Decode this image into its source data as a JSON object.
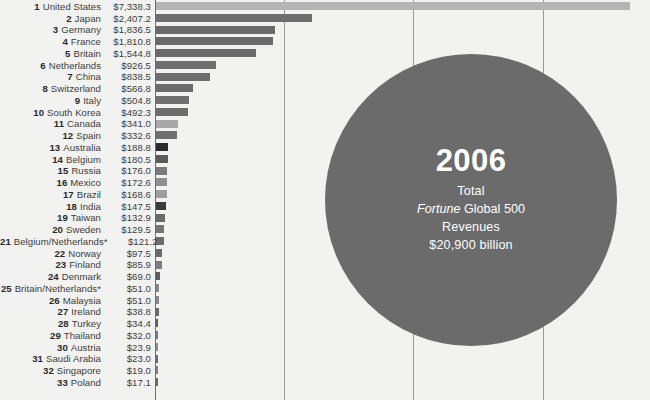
{
  "chart_data": {
    "type": "bar",
    "title": "",
    "orientation": "horizontal",
    "xlabel": "",
    "ylabel": "",
    "grid": true,
    "gridlines_x": [
      0,
      2000,
      4000,
      6000,
      8000
    ],
    "xlim": [
      0,
      7600
    ],
    "value_prefix": "$",
    "units": "billions of dollars",
    "categories": [
      "United States",
      "Japan",
      "Germany",
      "France",
      "Britain",
      "Netherlands",
      "China",
      "Switzerland",
      "Italy",
      "South Korea",
      "Canada",
      "Spain",
      "Australia",
      "Belgium",
      "Russia",
      "Mexico",
      "Brazil",
      "India",
      "Taiwan",
      "Sweden",
      "Belgium/Netherlands*",
      "Norway",
      "Finland",
      "Denmark",
      "Britain/Netherlands*",
      "Malaysia",
      "Ireland",
      "Turkey",
      "Thailand",
      "Austria",
      "Saudi Arabia",
      "Singapore",
      "Poland"
    ],
    "values": [
      7338.3,
      2407.2,
      1836.5,
      1810.8,
      1544.8,
      926.5,
      838.5,
      566.8,
      504.8,
      492.3,
      341.0,
      332.6,
      188.8,
      180.5,
      176.0,
      172.6,
      168.6,
      147.5,
      132.9,
      129.5,
      121.2,
      97.5,
      85.9,
      69.0,
      51.0,
      51.0,
      38.8,
      34.4,
      32.0,
      23.9,
      23.0,
      19.0,
      17.1
    ],
    "value_labels": [
      "$7,338.3",
      "$2,407.2",
      "$1,836.5",
      "$1,810.8",
      "$1,544.8",
      "$926.5",
      "$838.5",
      "$566.8",
      "$504.8",
      "$492.3",
      "$341.0",
      "$332.6",
      "$188.8",
      "$180.5",
      "$176.0",
      "$172.6",
      "$168.6",
      "$147.5",
      "$132.9",
      "$129.5",
      "$121.2",
      "$97.5",
      "$85.9",
      "$69.0",
      "$51.0",
      "$51.0",
      "$38.8",
      "$34.4",
      "$32.0",
      "$23.9",
      "$23.0",
      "$19.0",
      "$17.1"
    ],
    "ranks": [
      1,
      2,
      3,
      4,
      5,
      6,
      7,
      8,
      9,
      10,
      11,
      12,
      13,
      14,
      15,
      16,
      17,
      18,
      19,
      20,
      21,
      22,
      23,
      24,
      25,
      26,
      27,
      28,
      29,
      30,
      31,
      32,
      33
    ],
    "bar_colors": [
      "#b4b4b4",
      "#6e6e6e",
      "#6a6a6a",
      "#6a6a6a",
      "#6a6a6a",
      "#6e6e6e",
      "#6e6e6e",
      "#6b6b6b",
      "#707070",
      "#6c6c6c",
      "#a8a8a8",
      "#6f6f6f",
      "#2b2b2b",
      "#5b5b5b",
      "#7a7a7a",
      "#8f8f8f",
      "#9d9d9d",
      "#3a3a3a",
      "#6a6a6a",
      "#757575",
      "#6d6d6d",
      "#6a6a6a",
      "#7c7c7c",
      "#5d5d5d",
      "#8a8a8a",
      "#8a8a8a",
      "#6a6a6a",
      "#5c5c5c",
      "#7a7a7a",
      "#8f8f8f",
      "#6a6a6a",
      "#7f7f7f",
      "#6a6a6a"
    ],
    "annotation": {
      "shape": "circle",
      "year": "2006",
      "line1": "Total",
      "line2_italic": "Fortune",
      "line2_rest": " Global 500",
      "line3": "Revenues",
      "line4": "$20,900 billion",
      "fill_color": "#6b6b6b",
      "text_color": "#ffffff"
    },
    "footnote_marker": "*",
    "background_color": "#f2f2f0",
    "gridline_color": "#9a9a98"
  }
}
